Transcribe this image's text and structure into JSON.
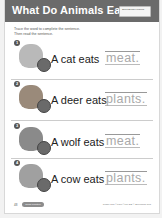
{
  "header": {
    "title": "What Do Animals Eat?",
    "badge": "Skills Builder Tracing"
  },
  "instructions": [
    "Trace the word to complete the sentence.",
    "Then read the sentence."
  ],
  "items": [
    {
      "number": "1",
      "animal": "cat",
      "food_icon": "meat-icon",
      "sentence": "A cat eats",
      "answer": "meat."
    },
    {
      "number": "2",
      "animal": "deer",
      "food_icon": "plants-icon",
      "sentence": "A deer eats",
      "answer": "plants."
    },
    {
      "number": "3",
      "animal": "wolf",
      "food_icon": "meat-icon",
      "sentence": "A wolf eats",
      "answer": "meat."
    },
    {
      "number": "4",
      "animal": "cow",
      "food_icon": "plants-icon",
      "sentence": "A cow eats",
      "answer": "plants."
    }
  ],
  "footer": {
    "page_number": "48",
    "pill_label": "Skills Practice",
    "copyright": "Grade Ran ©TCM ©MP DB © Benchmar Res"
  }
}
